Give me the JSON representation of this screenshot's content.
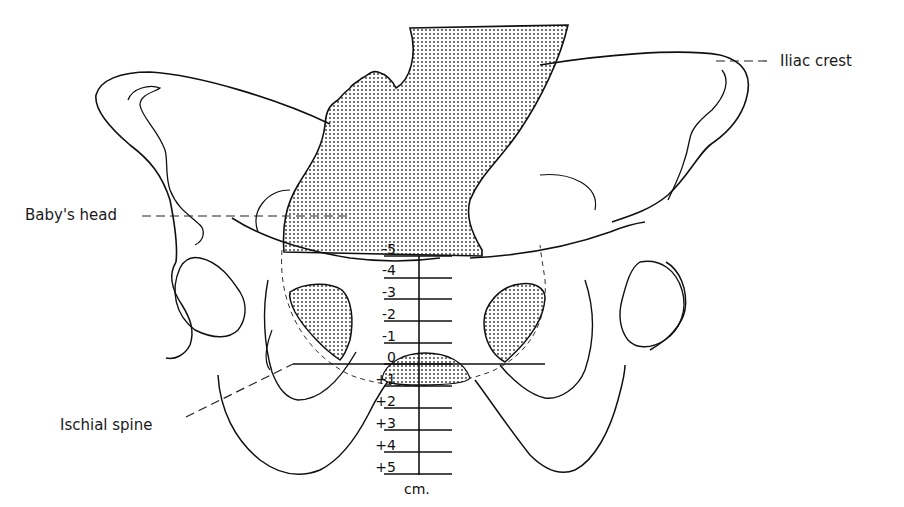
{
  "figure": {
    "labels": {
      "iliac_crest": "Iliac crest",
      "babys_head": "Baby's head",
      "ischial_spine": "Ischial spine"
    },
    "scale": {
      "unit": "cm.",
      "stations": [
        "-5",
        "-4",
        "-3",
        "-2",
        "-1",
        "0",
        "+1",
        "+2",
        "+3",
        "+4",
        "+5"
      ],
      "zero_reference": "0"
    },
    "colors": {
      "ink": "#111111",
      "background": "#ffffff",
      "stipple": "#333333"
    }
  }
}
